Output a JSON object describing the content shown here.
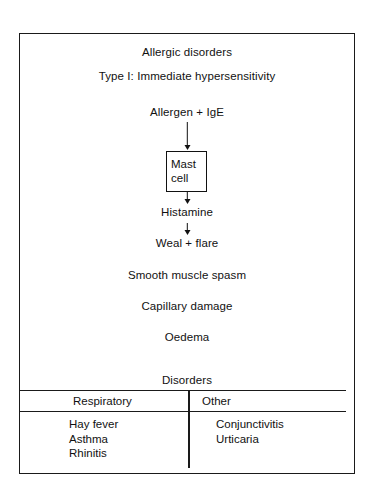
{
  "diagram": {
    "title_line_1": "Allergic disorders",
    "title_line_2": "Type I: Immediate hypersensitivity",
    "flow": {
      "allergen": "Allergen + IgE",
      "mast_cell_line_1": "Mast",
      "mast_cell_line_2": "cell",
      "histamine": "Histamine",
      "weal": "Weal + flare",
      "smooth_muscle": "Smooth muscle spasm",
      "capillary": "Capillary damage",
      "oedema": "Oedema"
    },
    "disorders_heading": "Disorders",
    "table": {
      "columns": [
        {
          "header": "Respiratory",
          "items": [
            "Hay fever",
            "Asthma",
            "Rhinitis"
          ]
        },
        {
          "header": "Other",
          "items": [
            "Conjunctivitis",
            "Urticaria"
          ]
        }
      ]
    },
    "colors": {
      "ink": "#111111",
      "rule": "#1a1a1a",
      "background": "#ffffff"
    }
  }
}
